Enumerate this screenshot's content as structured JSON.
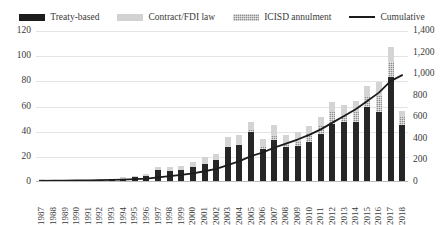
{
  "chart_data": {
    "type": "bar",
    "title": "",
    "subtitle": "",
    "xlabel": "",
    "ylabel": "",
    "grid": true,
    "legend_position": "top-center",
    "categories": [
      "1987",
      "1988",
      "1989",
      "1990",
      "1991",
      "1992",
      "1993",
      "1994",
      "1995",
      "1996",
      "1997",
      "1998",
      "1999",
      "2000",
      "2001",
      "2002",
      "2003",
      "2004",
      "2005",
      "2006",
      "2007",
      "2008",
      "2009",
      "2010",
      "2011",
      "2012",
      "2013",
      "2014",
      "2015",
      "2016",
      "2017",
      "2018"
    ],
    "left_axis": {
      "label": "",
      "ylim": [
        0,
        120
      ],
      "ticks": [
        "0",
        "20",
        "40",
        "60",
        "80",
        "100",
        "120"
      ],
      "tick_values": [
        0,
        20,
        40,
        60,
        80,
        100,
        120
      ]
    },
    "right_axis": {
      "label": "",
      "ylim": [
        0,
        1400
      ],
      "ticks": [
        "0",
        "200",
        "400",
        "600",
        "800",
        "1,000",
        "1,200",
        "1,400"
      ],
      "tick_values": [
        0,
        200,
        400,
        600,
        800,
        1000,
        1200,
        1400
      ]
    },
    "series": [
      {
        "name": "Treaty-based",
        "type": "bar-stacked",
        "color": "#262626",
        "values": [
          1,
          1,
          1,
          1,
          1,
          1,
          2,
          2,
          3,
          4,
          9,
          8,
          9,
          11,
          14,
          17,
          27,
          29,
          39,
          26,
          33,
          27,
          28,
          31,
          38,
          46,
          47,
          47,
          59,
          55,
          83,
          45
        ]
      },
      {
        "name": "ICISD annulment",
        "type": "bar-stacked",
        "color": "#8e8e8e",
        "values": [
          0,
          0,
          0,
          0,
          0,
          0,
          0,
          0,
          0,
          0,
          0,
          0,
          0,
          0,
          0,
          0,
          1,
          1,
          2,
          2,
          4,
          3,
          4,
          7,
          6,
          9,
          6,
          8,
          9,
          13,
          12,
          7
        ]
      },
      {
        "name": "Contract/FDI law",
        "type": "bar-stacked",
        "color": "#d4d4d4",
        "values": [
          1,
          0,
          0,
          0,
          0,
          1,
          0,
          1,
          1,
          2,
          2,
          3,
          3,
          4,
          5,
          5,
          7,
          7,
          6,
          6,
          8,
          7,
          7,
          6,
          7,
          8,
          8,
          9,
          8,
          11,
          12,
          4
        ]
      },
      {
        "name": "Cumulative",
        "type": "line",
        "color": "#1c1c1c",
        "axis": "right",
        "values": [
          2,
          3,
          4,
          5,
          6,
          8,
          10,
          13,
          17,
          23,
          34,
          45,
          57,
          72,
          91,
          113,
          148,
          185,
          232,
          266,
          311,
          348,
          387,
          431,
          482,
          545,
          606,
          670,
          746,
          825,
          932,
          988
        ]
      }
    ],
    "legend": [
      {
        "label": "Treaty-based",
        "marker": "square",
        "color": "#262626"
      },
      {
        "label": "Contract/FDI law",
        "marker": "square",
        "color": "#d4d4d4"
      },
      {
        "label": "ICISD annulment",
        "marker": "square-hatched",
        "color": "#8e8e8e"
      },
      {
        "label": "Cumulative",
        "marker": "line",
        "color": "#1c1c1c"
      }
    ]
  }
}
